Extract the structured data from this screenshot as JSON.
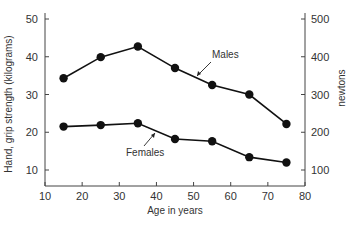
{
  "chart_data": {
    "type": "line",
    "title": "",
    "xlabel": "Age in years",
    "ylabel": "Hand, grip strength (kilograms)",
    "ylabel_right": "newtons",
    "xlim": [
      10,
      80
    ],
    "ylim": [
      5,
      50
    ],
    "ylim_right": [
      50,
      500
    ],
    "x_ticks": [
      10,
      20,
      30,
      40,
      50,
      60,
      70,
      80
    ],
    "y_ticks": [
      10,
      20,
      30,
      40,
      50
    ],
    "y_ticks_right": [
      100,
      200,
      300,
      400,
      500
    ],
    "grid": false,
    "x": [
      15,
      25,
      35,
      45,
      55,
      65,
      75
    ],
    "series": [
      {
        "name": "Males",
        "values": [
          34.3,
          39.9,
          42.7,
          37.0,
          32.5,
          30.0,
          22.2
        ]
      },
      {
        "name": "Females",
        "values": [
          21.5,
          21.9,
          22.4,
          18.2,
          17.6,
          13.4,
          12.0
        ]
      }
    ],
    "annotations": [
      {
        "text": "Males",
        "series": "Males",
        "near_x": 50
      },
      {
        "text": "Females",
        "series": "Females",
        "near_x": 40
      }
    ],
    "colors": {
      "line": "#111111",
      "marker": "#111111",
      "axis": "#444444",
      "text": "#333333"
    }
  }
}
